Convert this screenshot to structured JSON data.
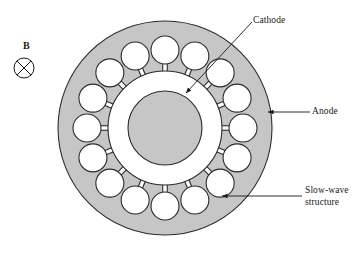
{
  "figure": {
    "type": "cross-section-schematic"
  },
  "labels": {
    "cathode": "Cathode",
    "anode": "Anode",
    "slow_wave_line1": "Slow-wave",
    "slow_wave_line2": "structure",
    "magnetic_field": "B"
  },
  "geometry": {
    "center_x": 165,
    "center_y": 128,
    "outer_radius": 107,
    "anode_inner_radius": 57,
    "cathode_radius": 37,
    "cavity_count": 16,
    "cavity_radius": 14,
    "cavity_orbit_radius": 78,
    "slot_width": 4.5,
    "field_symbol_cx": 24,
    "field_symbol_cy": 68,
    "field_symbol_r": 10
  },
  "colors": {
    "anode_fill": "#c6c6c6",
    "cathode_fill": "#c6c6c6",
    "outline": "#2b2b2b",
    "interaction_space": "#ffffff",
    "background": "#ffffff",
    "text": "#1a1a1a"
  },
  "leaders": {
    "cathode": {
      "x1": 252,
      "y1": 22,
      "x2": 186,
      "y2": 93
    },
    "anode": {
      "x1": 310,
      "y1": 112,
      "x2": 268,
      "y2": 112
    },
    "slow_wave": {
      "x1": 302,
      "y1": 196,
      "x2": 222,
      "y2": 196
    }
  }
}
